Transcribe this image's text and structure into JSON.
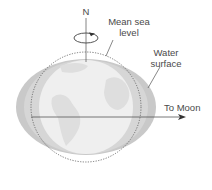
{
  "figure": {
    "labels": {
      "north": "N",
      "mean_sea_level_line1": "Mean sea",
      "mean_sea_level_line2": "level",
      "water_surface_line1": "Water",
      "water_surface_line2": "surface",
      "to_moon": "To Moon"
    },
    "colors": {
      "background": "#ffffff",
      "globe_fill": "#ececec",
      "continents": "#dcdcdc",
      "water_bulge": "#c8c8c8",
      "lines": "#555555",
      "text": "#4a4a4a"
    }
  }
}
